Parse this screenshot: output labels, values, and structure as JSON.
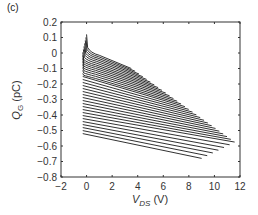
{
  "panel_label": "(c)",
  "chart_data": {
    "type": "line",
    "title": "",
    "xlabel": "V_DS (V)",
    "ylabel": "Q_G (pC)",
    "xlim": [
      -2,
      12
    ],
    "ylim": [
      -0.8,
      0.2
    ],
    "xticks": [
      -2,
      0,
      2,
      4,
      6,
      8,
      10,
      12
    ],
    "yticks": [
      0.2,
      0.1,
      0,
      -0.1,
      -0.2,
      -0.3,
      -0.4,
      -0.5,
      -0.6,
      -0.7,
      -0.8
    ],
    "xtick_labels": [
      "−2",
      "0",
      "2",
      "4",
      "6",
      "8",
      "10",
      "12"
    ],
    "ytick_labels": [
      "0.2",
      "0.1",
      "0",
      "−0.1",
      "−0.2",
      "−0.3",
      "−0.4",
      "−0.5",
      "−0.6",
      "−0.7",
      "−0.8"
    ],
    "grid": false,
    "legend": null,
    "line_color": "#1a1a1a",
    "series": [
      {
        "name": "curve-1",
        "x": [
          0.0,
          0.15,
          0.5,
          3.5
        ],
        "y": [
          0.12,
          0.0,
          -0.04,
          -0.1
        ]
      },
      {
        "name": "curve-top-mid",
        "x": [
          0.0,
          0.3,
          4.5
        ],
        "y": [
          -0.05,
          -0.12,
          -0.2
        ]
      },
      {
        "name": "curve-mid",
        "x": [
          -0.2,
          6.5
        ],
        "y": [
          -0.27,
          -0.4
        ]
      },
      {
        "name": "curve-long",
        "x": [
          -0.3,
          11.6
        ],
        "y": [
          -0.4,
          -0.62
        ]
      },
      {
        "name": "curve-bottom",
        "x": [
          -0.3,
          9.0
        ],
        "y": [
          -0.52,
          -0.68
        ]
      }
    ],
    "family": {
      "count": 34,
      "x_start": -0.3,
      "y_start_top": 0.12,
      "y_start_bottom": -0.52,
      "x_end_top": 3.5,
      "x_end_max": 11.6,
      "x_end_bottom": 9.0,
      "y_end_top": -0.1,
      "y_end_bottom": -0.68
    }
  }
}
